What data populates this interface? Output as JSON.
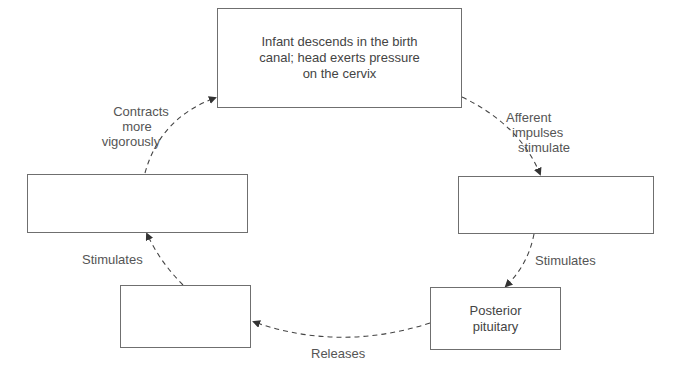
{
  "diagram": {
    "nodes": [
      {
        "id": "top",
        "lines": [
          "Infant descends in the birth",
          "canal; head exerts pressure",
          "on the cervix"
        ]
      },
      {
        "id": "right_middle",
        "lines": []
      },
      {
        "id": "posterior_pituitary",
        "lines": [
          "Posterior",
          "pituitary"
        ]
      },
      {
        "id": "bottom_left",
        "lines": []
      },
      {
        "id": "left_middle",
        "lines": []
      }
    ],
    "edges": [
      {
        "from": "top",
        "to": "right_middle",
        "label_lines": [
          "Afferent",
          "impulses",
          "stimulate"
        ]
      },
      {
        "from": "right_middle",
        "to": "posterior_pituitary",
        "label_lines": [
          "Stimulates"
        ]
      },
      {
        "from": "posterior_pituitary",
        "to": "bottom_left",
        "label_lines": [
          "Releases"
        ]
      },
      {
        "from": "bottom_left",
        "to": "left_middle",
        "label_lines": [
          "Stimulates"
        ]
      },
      {
        "from": "left_middle",
        "to": "top",
        "label_lines": [
          "Contracts",
          "more",
          "vigorously"
        ]
      }
    ],
    "style": {
      "box_border": "#6f6f6f",
      "arrow_color": "#333333",
      "text_color": "#444444",
      "background": "#ffffff"
    }
  }
}
